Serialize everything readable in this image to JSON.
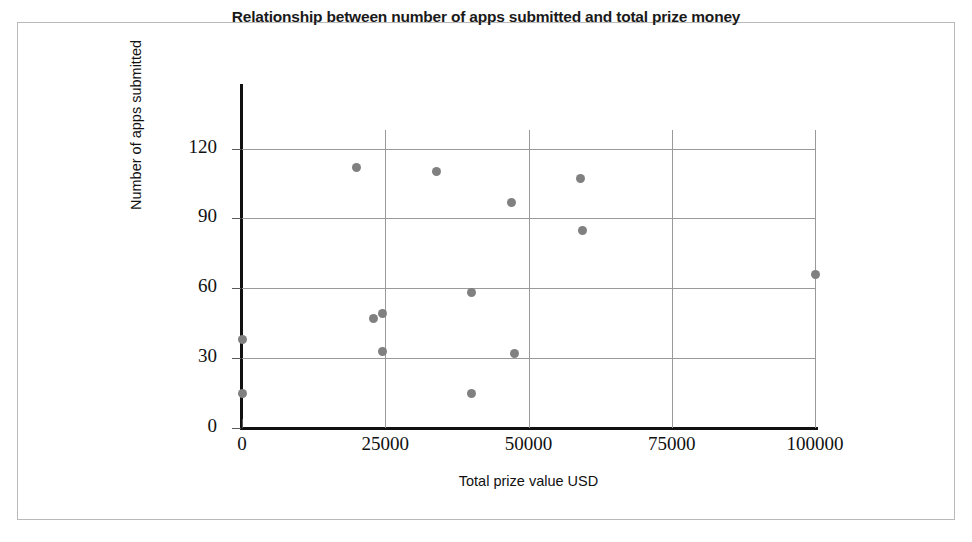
{
  "chart_data": {
    "type": "scatter",
    "title": "Relationship between number of apps submitted and total prize money",
    "xlabel": "Total prize value USD",
    "ylabel": "Number of apps submitted",
    "xlim": [
      0,
      100000
    ],
    "ylim": [
      0,
      128
    ],
    "grid": true,
    "legend": "none",
    "marker_color": "#808080",
    "axis_color": "#111111",
    "gridline_color": "#9a9a9a",
    "frame_color": "#b9b9b9",
    "xticks": [
      0,
      25000,
      50000,
      75000,
      100000
    ],
    "xtick_labels": [
      "0",
      "25000",
      "50000",
      "75000",
      "100000"
    ],
    "yticks": [
      0,
      30,
      60,
      90,
      120
    ],
    "ytick_labels": [
      "0",
      "30",
      "60",
      "90",
      "120"
    ],
    "points": [
      {
        "x": 0,
        "y": 38
      },
      {
        "x": 0,
        "y": 15
      },
      {
        "x": 20000,
        "y": 112
      },
      {
        "x": 23000,
        "y": 47
      },
      {
        "x": 24500,
        "y": 49
      },
      {
        "x": 24500,
        "y": 33
      },
      {
        "x": 34000,
        "y": 110
      },
      {
        "x": 40000,
        "y": 58
      },
      {
        "x": 40000,
        "y": 15
      },
      {
        "x": 47000,
        "y": 97
      },
      {
        "x": 47500,
        "y": 32
      },
      {
        "x": 59000,
        "y": 107
      },
      {
        "x": 59500,
        "y": 85
      },
      {
        "x": 100000,
        "y": 66
      }
    ]
  }
}
